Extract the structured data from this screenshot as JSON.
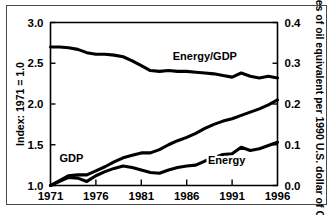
{
  "chart_data": {
    "type": "line",
    "title": "",
    "xlabel": "",
    "ylabel": "Index: 1971 = 1.0",
    "y2label": "Tonnes of oil equivalent per 1990 U.S. dollar of GDP",
    "xlim": [
      1971,
      1996
    ],
    "ylim": [
      1.0,
      3.0
    ],
    "y2lim": [
      0.0,
      0.4
    ],
    "grid": false,
    "legend_position": "inline-annotations",
    "xticks": [
      "1971",
      "1976",
      "1981",
      "1986",
      "1991",
      "1996"
    ],
    "xtick_values": [
      1971,
      1976,
      1981,
      1986,
      1991,
      1996
    ],
    "yticks": [
      "1.0",
      "1.5",
      "2.0",
      "2.5",
      "3.0"
    ],
    "ytick_values": [
      1.0,
      1.5,
      2.0,
      2.5,
      3.0
    ],
    "y2ticks": [
      "0.0",
      "0.1",
      "0.2",
      "0.3",
      "0.4"
    ],
    "y2tick_values": [
      0.0,
      0.1,
      0.2,
      0.3,
      0.4
    ],
    "x": [
      1971,
      1972,
      1973,
      1974,
      1975,
      1976,
      1977,
      1978,
      1979,
      1980,
      1981,
      1982,
      1983,
      1984,
      1985,
      1986,
      1987,
      1988,
      1989,
      1990,
      1991,
      1992,
      1993,
      1994,
      1995,
      1996
    ],
    "series": [
      {
        "name": "Energy/GDP",
        "axis": "right",
        "label_x": 1988.0,
        "label_y": 2.54,
        "values": [
          2.7,
          2.7,
          2.69,
          2.67,
          2.63,
          2.61,
          2.61,
          2.6,
          2.58,
          2.53,
          2.47,
          2.41,
          2.4,
          2.41,
          2.4,
          2.4,
          2.39,
          2.38,
          2.37,
          2.35,
          2.33,
          2.38,
          2.34,
          2.32,
          2.34,
          2.32
        ]
      },
      {
        "name": "GDP",
        "axis": "left",
        "label_x": 1973.3,
        "label_y": 1.29,
        "values": [
          1.0,
          1.06,
          1.12,
          1.13,
          1.13,
          1.18,
          1.23,
          1.29,
          1.34,
          1.37,
          1.4,
          1.4,
          1.44,
          1.5,
          1.55,
          1.59,
          1.64,
          1.7,
          1.75,
          1.79,
          1.82,
          1.86,
          1.9,
          1.94,
          1.99,
          2.05
        ]
      },
      {
        "name": "Energy",
        "axis": "left",
        "label_x": 1990.4,
        "label_y": 1.26,
        "values": [
          1.0,
          1.05,
          1.1,
          1.09,
          1.05,
          1.12,
          1.17,
          1.21,
          1.24,
          1.22,
          1.19,
          1.16,
          1.15,
          1.19,
          1.22,
          1.24,
          1.25,
          1.3,
          1.34,
          1.38,
          1.39,
          1.47,
          1.43,
          1.45,
          1.49,
          1.53
        ]
      }
    ]
  }
}
